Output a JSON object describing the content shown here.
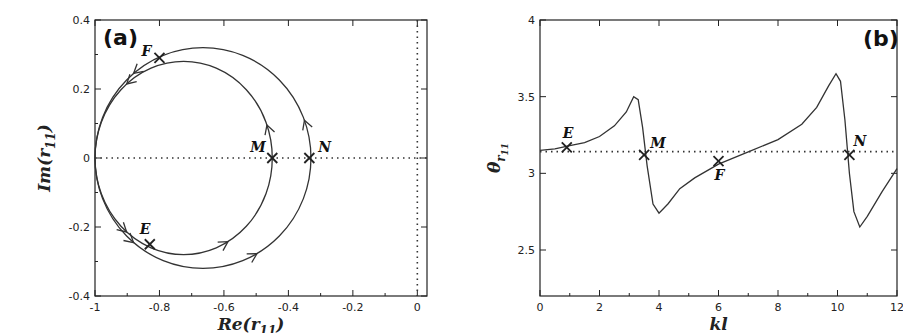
{
  "chart_data": [
    {
      "panel": "(a)",
      "type": "line",
      "title": "",
      "xlabel": "Re(r11)",
      "ylabel": "Im(r11)",
      "xlim": [
        -1,
        0.03
      ],
      "ylim": [
        -0.4,
        0.4
      ],
      "xticks": [
        -1,
        -0.8,
        -0.6,
        -0.4,
        -0.2,
        0
      ],
      "xtick_labels": [
        "-1",
        "-0.8",
        "-0.6",
        "-0.4",
        "-0.2",
        "0"
      ],
      "yticks": [
        -0.4,
        -0.2,
        0,
        0.2,
        0.4
      ],
      "ytick_labels": [
        "-0.4",
        "-0.2",
        "0",
        "0.2",
        "0.4"
      ],
      "grid": false,
      "reference_lines": [
        {
          "orientation": "horizontal",
          "value": 0,
          "style": "dotted"
        },
        {
          "orientation": "vertical",
          "value": 0,
          "style": "dotted"
        }
      ],
      "series": [
        {
          "name": "inner loop",
          "shape": "closed loop",
          "center": [
            -0.725,
            0.0
          ],
          "radius_x": 0.275,
          "radius_y": 0.28,
          "direction": "counter-clockwise arrows"
        },
        {
          "name": "outer loop",
          "shape": "closed loop",
          "center": [
            -0.665,
            0.0
          ],
          "radius_x": 0.335,
          "radius_y": 0.32,
          "direction": "counter-clockwise arrows"
        }
      ],
      "points": [
        {
          "label": "F",
          "x": -0.8,
          "y": 0.29
        },
        {
          "label": "E",
          "x": -0.83,
          "y": -0.25
        },
        {
          "label": "M",
          "x": -0.45,
          "y": 0.0
        },
        {
          "label": "N",
          "x": -0.335,
          "y": 0.0
        }
      ]
    },
    {
      "panel": "(b)",
      "type": "line",
      "title": "",
      "xlabel": "kl",
      "ylabel": "θ_{r11}",
      "xlim": [
        0,
        12
      ],
      "ylim": [
        2.2,
        4
      ],
      "xticks": [
        0,
        2,
        4,
        6,
        8,
        10,
        12
      ],
      "xtick_labels": [
        "0",
        "2",
        "4",
        "6",
        "8",
        "10",
        "12"
      ],
      "yticks": [
        2.5,
        3,
        3.5,
        4
      ],
      "ytick_labels": [
        "2.5",
        "3",
        "3.5",
        "4"
      ],
      "grid": false,
      "reference_lines": [
        {
          "orientation": "horizontal",
          "value": 3.1416,
          "style": "dotted"
        }
      ],
      "series": [
        {
          "name": "theta_r11",
          "x": [
            0,
            0.5,
            1,
            1.5,
            2,
            2.5,
            2.9,
            3.15,
            3.3,
            3.45,
            3.6,
            3.8,
            4.0,
            4.3,
            4.7,
            5.2,
            6,
            7,
            8,
            8.8,
            9.3,
            9.7,
            9.95,
            10.1,
            10.25,
            10.4,
            10.55,
            10.75,
            11,
            11.5,
            12
          ],
          "y": [
            3.15,
            3.16,
            3.18,
            3.2,
            3.24,
            3.31,
            3.4,
            3.5,
            3.48,
            3.3,
            3.05,
            2.8,
            2.74,
            2.8,
            2.9,
            2.97,
            3.06,
            3.14,
            3.22,
            3.32,
            3.43,
            3.57,
            3.65,
            3.6,
            3.35,
            3.0,
            2.75,
            2.65,
            2.72,
            2.88,
            3.03
          ]
        }
      ],
      "points": [
        {
          "label": "E",
          "x": 0.9,
          "y": 3.17
        },
        {
          "label": "M",
          "x": 3.5,
          "y": 3.12
        },
        {
          "label": "F",
          "x": 6.0,
          "y": 3.08
        },
        {
          "label": "N",
          "x": 10.4,
          "y": 3.12
        }
      ]
    }
  ],
  "labels": {
    "panel_a": "(a)",
    "panel_b": "(b)",
    "a_xlabel_main": "Re(r",
    "a_xlabel_sub": "11",
    "a_xlabel_close": ")",
    "a_ylabel_main": "Im(r",
    "a_ylabel_sub": "11",
    "a_ylabel_close": ")",
    "b_xlabel": "kl",
    "b_ylabel_main": "θ",
    "b_ylabel_sub": "r",
    "b_ylabel_subsub": "11"
  }
}
